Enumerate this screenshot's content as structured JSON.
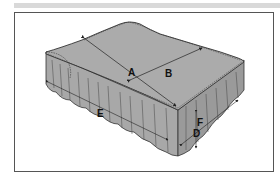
{
  "figure": {
    "labels": {
      "A": "A",
      "B": "B",
      "C": "C",
      "D": "D",
      "E": "E",
      "F": "F"
    },
    "colors": {
      "fabric": "#a8a8a8",
      "fabric_dark": "#8e8e8e",
      "outline": "#333333",
      "frame": "#555555",
      "top_band": "#d9d9d9"
    }
  }
}
